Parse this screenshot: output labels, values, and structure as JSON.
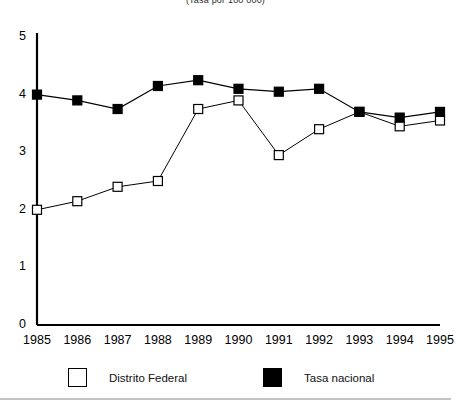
{
  "subtitle": "(Tasa por 100 000)",
  "legend": {
    "items": [
      {
        "label": "Distrito Federal",
        "marker": "open-square",
        "color": "#ffffff"
      },
      {
        "label": "Tasa nacional",
        "marker": "filled-square",
        "color": "#000000"
      }
    ]
  },
  "axes": {
    "y_ticks": [
      "0",
      "1",
      "2",
      "3",
      "4",
      "5"
    ],
    "x_ticks": [
      "1985",
      "1986",
      "1987",
      "1988",
      "1989",
      "1990",
      "1991",
      "1992",
      "1993",
      "1994",
      "1995"
    ]
  },
  "chart_data": {
    "type": "line",
    "title": "",
    "subtitle": "(Tasa por 100 000)",
    "xlabel": "",
    "ylabel": "",
    "x": [
      1985,
      1986,
      1987,
      1988,
      1989,
      1990,
      1991,
      1992,
      1993,
      1994,
      1995
    ],
    "categories": [
      "1985",
      "1986",
      "1987",
      "1988",
      "1989",
      "1990",
      "1991",
      "1992",
      "1993",
      "1994",
      "1995"
    ],
    "series": [
      {
        "name": "Distrito Federal",
        "marker": "open-square",
        "color": "#ffffff",
        "edge_color": "#000000",
        "values": [
          2.0,
          2.15,
          2.4,
          2.5,
          3.75,
          3.9,
          2.95,
          3.4,
          3.7,
          3.45,
          3.55
        ]
      },
      {
        "name": "Tasa nacional",
        "marker": "filled-square",
        "color": "#000000",
        "edge_color": "#000000",
        "values": [
          4.0,
          3.9,
          3.75,
          4.15,
          4.25,
          4.1,
          4.05,
          4.1,
          3.7,
          3.6,
          3.7
        ]
      }
    ],
    "ylim": [
      0,
      5
    ],
    "yticks": [
      0,
      1,
      2,
      3,
      4,
      5
    ],
    "xlim": [
      1985,
      1995
    ],
    "grid": false,
    "legend_position": "bottom"
  }
}
